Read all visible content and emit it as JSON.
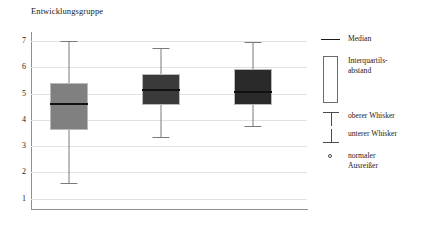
{
  "chart_data": {
    "type": "bar",
    "title": "Entwicklungsgruppe",
    "subtitle": "",
    "xlabel": "",
    "ylabel": "",
    "ylim": [
      0.6,
      7.35
    ],
    "yticks": [
      1,
      2,
      3,
      4,
      5,
      6,
      7
    ],
    "ytick_labels": [
      "1",
      "2",
      "3",
      "4",
      "5",
      "6",
      "7"
    ],
    "grid": true,
    "legend_position": "right",
    "categories": [
      "t1",
      "t2",
      "t3"
    ],
    "category_labels": [
      "t",
      "t",
      "t"
    ],
    "category_subscripts": [
      "1",
      "2",
      "3"
    ],
    "boxes": [
      {
        "category": "t1",
        "whisker_low": 1.6,
        "q1": 3.6,
        "median": 4.6,
        "q3": 5.4,
        "whisker_high": 7.0,
        "fill": "#808080"
      },
      {
        "category": "t2",
        "whisker_low": 3.35,
        "q1": 4.55,
        "median": 5.15,
        "q3": 5.75,
        "whisker_high": 6.75,
        "fill": "#3a3a3a"
      },
      {
        "category": "t3",
        "whisker_low": 3.75,
        "q1": 4.55,
        "median": 5.05,
        "q3": 5.95,
        "whisker_high": 6.95,
        "fill": "#2a2a2a"
      }
    ],
    "outliers": []
  },
  "legend": {
    "items": [
      {
        "glyph": "median-line-icon",
        "label": "Median"
      },
      {
        "glyph": "iqr-box-icon",
        "label": "Interquartils-\nabstand"
      },
      {
        "glyph": "upper-whisker-icon",
        "label": "oberer Whisker"
      },
      {
        "glyph": "lower-whisker-icon",
        "label": "unterer Whisker"
      },
      {
        "glyph": "outlier-circle-icon",
        "label": "normaler\nAusreißer"
      }
    ]
  },
  "colors": {
    "axis": "#8f8f8f",
    "gridline": "#e2e2e2",
    "whisker": "#7a7a7a",
    "median": "#111111",
    "box_border": "#b9b9b9",
    "text": "#1a1a1a"
  }
}
